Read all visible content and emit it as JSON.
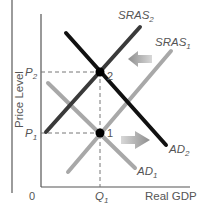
{
  "diagram": {
    "type": "AS-AD model",
    "y_axis_label": "Price Level",
    "x_axis_label": "Real GDP",
    "origin_label": "0",
    "price_levels": [
      {
        "name": "P",
        "sub": "2",
        "y": 72
      },
      {
        "name": "P",
        "sub": "1",
        "y": 133
      }
    ],
    "quantity_label": {
      "name": "Q",
      "sub": "1",
      "x": 100
    },
    "curves": [
      {
        "id": "SRAS2",
        "name": "SRAS",
        "sub": "2",
        "color": "#3a3a3a",
        "x1": 46,
        "y1": 132,
        "x2": 140,
        "y2": 27,
        "label_x": 118,
        "label_y": 19
      },
      {
        "id": "SRAS1",
        "name": "SRAS",
        "sub": "1",
        "color": "#a8a8a8",
        "x1": 68,
        "y1": 172,
        "x2": 171,
        "y2": 51,
        "label_x": 157,
        "label_y": 46
      },
      {
        "id": "AD2",
        "name": "AD",
        "sub": "2",
        "color": "#111111",
        "x1": 66,
        "y1": 33,
        "x2": 166,
        "y2": 145,
        "label_x": 170,
        "label_y": 152
      },
      {
        "id": "AD1",
        "name": "AD",
        "sub": "1",
        "color": "#a8a8a8",
        "x1": 48,
        "y1": 83,
        "x2": 135,
        "y2": 168,
        "label_x": 138,
        "label_y": 174
      }
    ],
    "equilibrium_points": [
      {
        "label": "2",
        "x": 100,
        "y": 72
      },
      {
        "label": "1",
        "x": 100,
        "y": 133
      }
    ],
    "shift_arrows": [
      {
        "direction": "left",
        "meaning": "SRAS shifts left"
      },
      {
        "direction": "right",
        "meaning": "AD shifts right"
      }
    ],
    "colors": {
      "axis": "#555555",
      "dashed": "#777777",
      "text": "#555555",
      "arrow": "#9a9a9a"
    }
  }
}
